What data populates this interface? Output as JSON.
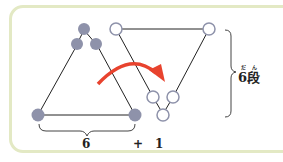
{
  "diagram": {
    "left_triangle": {
      "fill": "#8e92aa",
      "description": "filled triangle of dots"
    },
    "right_triangle": {
      "fill": "#ffffff",
      "stroke": "#8e92aa",
      "description": "inverted triangle of hollow dots"
    },
    "arrow_color": "#e8432e",
    "border_color": "#e3e9c4",
    "brace_right_label": "6段",
    "brace_right_label_ruby": "だん",
    "bottom_label_left": "6",
    "bottom_plus": "+",
    "bottom_label_right": "1"
  }
}
